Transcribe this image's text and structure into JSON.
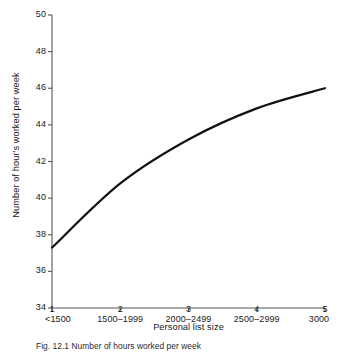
{
  "figure": {
    "caption": "Fig. 12.1  Number of hours worked per week"
  },
  "chart_data": {
    "type": "line",
    "title": "",
    "xlabel": "Personal list size",
    "ylabel": "Number of hour's worked per week",
    "x": [
      1,
      2,
      3,
      4,
      5
    ],
    "categories": [
      "<1500",
      "1500–1999",
      "2000–2499",
      "2500–2999",
      "3000"
    ],
    "xtick_numbers": [
      "1",
      "2",
      "3",
      "4",
      "5"
    ],
    "values": [
      37.3,
      40.8,
      43.2,
      44.9,
      46.0
    ],
    "yticks": [
      34,
      36,
      38,
      40,
      42,
      44,
      46,
      48,
      50
    ],
    "ytick_labels": [
      "34",
      "36",
      "38",
      "40",
      "42",
      "44",
      "46",
      "48",
      "50"
    ],
    "xlim": [
      1,
      5
    ],
    "ylim": [
      34,
      50
    ],
    "grid": false,
    "legend": null,
    "line_color": "#111111",
    "line_width": 2.2,
    "axis_color": "#555555"
  }
}
